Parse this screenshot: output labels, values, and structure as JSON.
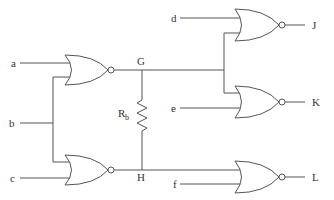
{
  "diagram": {
    "type": "logic-circuit",
    "gate_type": "NOR",
    "inputs": {
      "a": "a",
      "b": "b",
      "c": "c",
      "d": "d",
      "e": "e",
      "f": "f"
    },
    "nodes": {
      "G": "G",
      "H": "H"
    },
    "outputs": {
      "J": "J",
      "K": "K",
      "L": "L"
    },
    "resistor": {
      "label": "R",
      "subscript": "b"
    },
    "gates": [
      {
        "id": "gate1",
        "inputs": [
          "a",
          "b"
        ],
        "output": "G"
      },
      {
        "id": "gate2",
        "inputs": [
          "b",
          "c"
        ],
        "output": "H"
      },
      {
        "id": "gate3",
        "inputs": [
          "d",
          "G"
        ],
        "output": "J"
      },
      {
        "id": "gate4",
        "inputs": [
          "G",
          "e"
        ],
        "output": "K"
      },
      {
        "id": "gate5",
        "inputs": [
          "H",
          "f"
        ],
        "output": "L"
      }
    ],
    "colors": {
      "line": "#555555",
      "text": "#333333",
      "background": "#ffffff"
    }
  }
}
